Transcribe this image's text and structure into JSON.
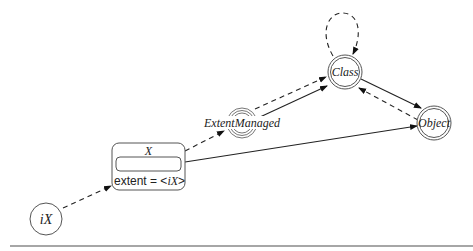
{
  "diagram": {
    "nodes": {
      "ix": {
        "label": "iX"
      },
      "x": {
        "title": "X",
        "attribute": "extent = ",
        "attribute_prefix": "extent = <",
        "attribute_value": "iX",
        "attribute_suffix": ">"
      },
      "extent_managed": {
        "label": "ExtentManaged"
      },
      "class": {
        "label": "Class"
      },
      "object": {
        "label": "Object"
      }
    },
    "edges": [
      {
        "from": "iX",
        "to": "X",
        "style": "dashed"
      },
      {
        "from": "X",
        "to": "ExtentManaged",
        "style": "dashed"
      },
      {
        "from": "X",
        "to": "Object",
        "style": "solid"
      },
      {
        "from": "ExtentManaged",
        "to": "Class",
        "style": "dashed"
      },
      {
        "from": "ExtentManaged",
        "to": "Class",
        "style": "solid"
      },
      {
        "from": "Class",
        "to": "Object",
        "style": "solid"
      },
      {
        "from": "Object",
        "to": "Class",
        "style": "dashed"
      },
      {
        "from": "Class",
        "to": "Class",
        "style": "dashed"
      }
    ],
    "colors": {
      "stroke": "#222222",
      "node_stroke": "#555555",
      "rule": "#888888"
    }
  }
}
